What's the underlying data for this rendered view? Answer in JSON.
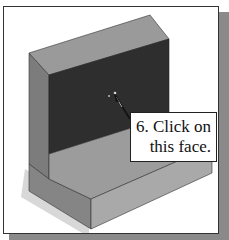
{
  "figure": {
    "type": "cad-instruction-illustration",
    "callout": {
      "line1": "6. Click on",
      "line2": "this face."
    },
    "colors": {
      "frame_border": "#333333",
      "shadow": "#8a8a8a",
      "top_face": "#9a9a9a",
      "selected_face": "#2e2e2e",
      "side_face": "#7e7e7e",
      "floor_face": "#9c9c9c",
      "front_face": "#a8a8a8"
    },
    "icons": {
      "cursor": "pointer-arrow-icon",
      "click_marker": "click-point-icon"
    }
  }
}
